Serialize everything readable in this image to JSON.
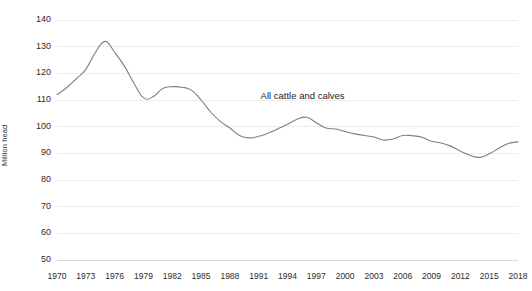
{
  "chart_data": {
    "type": "line",
    "title": "",
    "xlabel": "",
    "ylabel": "Million head",
    "ylim": [
      50,
      140
    ],
    "xlim": [
      1970,
      2018
    ],
    "grid": true,
    "legend_position": "inline-annotation",
    "y_ticks": [
      140,
      130,
      120,
      110,
      100,
      90,
      80,
      70,
      60,
      50
    ],
    "x_ticks": [
      1970,
      1973,
      1976,
      1979,
      1982,
      1985,
      1988,
      1991,
      1994,
      1997,
      2000,
      2003,
      2006,
      2009,
      2012,
      2015,
      2018
    ],
    "series": [
      {
        "name": "All cattle and calves",
        "color": "#7f7f7f",
        "x": [
          1970,
          1971,
          1972,
          1973,
          1974,
          1975,
          1976,
          1977,
          1978,
          1979,
          1980,
          1981,
          1982,
          1983,
          1984,
          1985,
          1986,
          1987,
          1988,
          1989,
          1990,
          1991,
          1992,
          1993,
          1994,
          1995,
          1996,
          1997,
          1998,
          1999,
          2000,
          2001,
          2002,
          2003,
          2004,
          2005,
          2006,
          2007,
          2008,
          2009,
          2010,
          2011,
          2012,
          2013,
          2014,
          2015,
          2016,
          2017,
          2018
        ],
        "values": [
          112.0,
          114.6,
          117.9,
          121.5,
          127.8,
          132.0,
          127.9,
          122.8,
          116.4,
          110.9,
          111.2,
          114.3,
          115.0,
          114.8,
          113.7,
          110.0,
          105.5,
          102.0,
          99.5,
          96.7,
          95.8,
          96.4,
          97.6,
          99.2,
          100.9,
          102.8,
          103.5,
          101.5,
          99.5,
          99.1,
          98.2,
          97.3,
          96.7,
          96.1,
          95.0,
          95.4,
          96.7,
          96.6,
          96.0,
          94.5,
          93.9,
          92.7,
          90.8,
          89.3,
          88.5,
          89.8,
          91.9,
          93.7,
          94.3
        ]
      }
    ]
  },
  "annotation": {
    "series_label": "All cattle and calves"
  }
}
